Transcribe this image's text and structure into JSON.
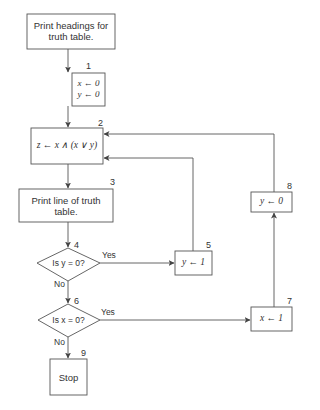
{
  "flowchart": {
    "nodes": [
      {
        "id": "start",
        "number": "",
        "type": "process",
        "text": "Print headings for truth table."
      },
      {
        "id": "1",
        "number": "1",
        "type": "process",
        "lines": [
          "x ← 0",
          "y ← 0"
        ]
      },
      {
        "id": "2",
        "number": "2",
        "type": "process",
        "text": "z ← x ∧ (x ∨ y)"
      },
      {
        "id": "3",
        "number": "3",
        "type": "process",
        "text": "Print line of truth table."
      },
      {
        "id": "4",
        "number": "4",
        "type": "decision",
        "text": "Is y = 0?"
      },
      {
        "id": "5",
        "number": "5",
        "type": "process",
        "text": "y ← 1"
      },
      {
        "id": "6",
        "number": "6",
        "type": "decision",
        "text": "Is x = 0?"
      },
      {
        "id": "7",
        "number": "7",
        "type": "process",
        "text": "x ← 1"
      },
      {
        "id": "8",
        "number": "8",
        "type": "process",
        "text": "y ← 0"
      },
      {
        "id": "9",
        "number": "9",
        "type": "terminal",
        "text": "Stop"
      }
    ],
    "edge_labels": {
      "yes": "Yes",
      "no": "No"
    }
  }
}
